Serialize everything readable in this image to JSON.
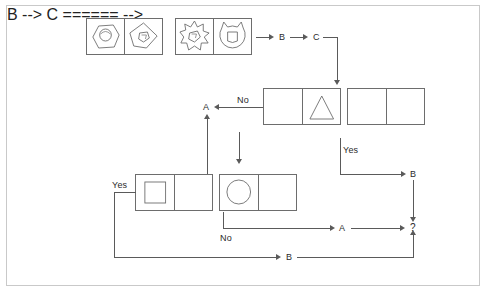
{
  "diagram": {
    "kind": "visual-analogy-flowchart",
    "background_color": "#ffffff",
    "frame_color": "#c9c9c9",
    "stroke_color": "#5a5a5a",
    "box_border_color": "#6d6d6d",
    "labels": {
      "b_top": "B",
      "c_top": "C",
      "a_mid": "A",
      "no_mid": "No",
      "yes_right": "Yes",
      "b_right": "B",
      "yes_left": "Yes",
      "no_bottom": "No",
      "a_bottom": "A",
      "question": "?",
      "b_bottom": "B"
    },
    "panels": [
      {
        "name": "pair-1",
        "cells": [
          {
            "name": "hexagon-with-circle",
            "outer": "hexagon",
            "inner": "circle"
          },
          {
            "name": "blob-with-pentagon",
            "outer": "blob",
            "inner": "pentagon"
          }
        ]
      },
      {
        "name": "pair-2",
        "cells": [
          {
            "name": "starburst-with-pentagon",
            "outer": "starburst",
            "inner": "pentagon"
          },
          {
            "name": "horned-circle-with-rounded-square",
            "outer": "horned-circle",
            "inner": "rounded-square"
          }
        ]
      },
      {
        "name": "pair-3",
        "cells": [
          {
            "name": "empty-cell",
            "outer": "none",
            "inner": "none"
          },
          {
            "name": "triangle-cell",
            "outer": "triangle",
            "inner": "none"
          }
        ]
      },
      {
        "name": "pair-4",
        "cells": [
          {
            "name": "empty-cell",
            "outer": "none",
            "inner": "none"
          },
          {
            "name": "empty-cell",
            "outer": "none",
            "inner": "none"
          }
        ]
      },
      {
        "name": "pair-5",
        "cells": [
          {
            "name": "square-cell",
            "outer": "square",
            "inner": "none"
          },
          {
            "name": "empty-cell",
            "outer": "none",
            "inner": "none"
          }
        ]
      },
      {
        "name": "pair-6",
        "cells": [
          {
            "name": "circle-cell",
            "outer": "circle",
            "inner": "none"
          },
          {
            "name": "empty-cell",
            "outer": "none",
            "inner": "none"
          }
        ]
      }
    ]
  }
}
